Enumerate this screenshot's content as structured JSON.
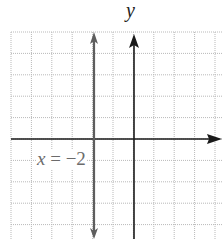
{
  "chart_data": {
    "type": "line",
    "title": "",
    "xlabel": "",
    "ylabel": "y",
    "grid": true,
    "xlim": [
      -6,
      4
    ],
    "ylim": [
      -5,
      5
    ],
    "series": [
      {
        "name": "x = -2",
        "kind": "vertical-line",
        "x": [
          -2,
          -2
        ],
        "y": [
          -5,
          5
        ],
        "color": "#6b6b6b"
      }
    ],
    "annotations": [
      {
        "text": "x = −2",
        "x": -5,
        "y": -1
      }
    ]
  },
  "labels": {
    "y_axis": "y",
    "equation_var": "x",
    "equation_eq": " = ",
    "equation_val": "−2"
  },
  "colors": {
    "grid": "#b9b9b9",
    "axis": "#1a1a1a",
    "line": "#6b6b6b",
    "label": "#6b6b6b"
  }
}
